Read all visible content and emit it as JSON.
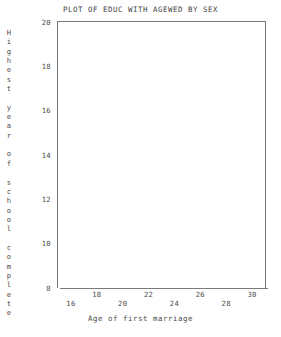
{
  "chart_data": {
    "type": "scatter",
    "title": "PLOT OF EDUC WITH AGEWED BY SEX",
    "xlabel": "Age of first marriage",
    "ylabel": "Highest year of school complete",
    "xlim": [
      15,
      31
    ],
    "ylim": [
      8,
      20
    ],
    "xticks": [
      16,
      18,
      20,
      22,
      24,
      26,
      28,
      30
    ],
    "yticks": [
      20,
      18,
      16,
      14,
      12,
      10,
      8
    ],
    "xtick_labels": [
      "16",
      "18",
      "20",
      "22",
      "24",
      "26",
      "28",
      "30"
    ],
    "ytick_labels": [
      "20",
      "18",
      "16",
      "14",
      "12",
      "10",
      "8"
    ],
    "grid": false,
    "legend": null,
    "series": [],
    "points": []
  },
  "figure": {
    "title": "PLOT OF EDUC WITH AGEWED BY SEX",
    "x_axis": {
      "title": "Age of first marriage",
      "ticks": [
        {
          "label": "16",
          "value": 16,
          "row": "lower"
        },
        {
          "label": "18",
          "value": 18,
          "row": "upper"
        },
        {
          "label": "20",
          "value": 20,
          "row": "lower"
        },
        {
          "label": "22",
          "value": 22,
          "row": "upper"
        },
        {
          "label": "24",
          "value": 24,
          "row": "lower"
        },
        {
          "label": "26",
          "value": 26,
          "row": "upper"
        },
        {
          "label": "28",
          "value": 28,
          "row": "lower"
        },
        {
          "label": "30",
          "value": 30,
          "row": "upper"
        }
      ]
    },
    "y_axis": {
      "title": "Highest year of school complete",
      "title_chars": [
        "H",
        "i",
        "g",
        "h",
        "e",
        "s",
        "t",
        " ",
        "y",
        "e",
        "a",
        "r",
        " ",
        "o",
        "f",
        " ",
        "s",
        "c",
        "h",
        "o",
        "o",
        "l",
        " ",
        "c",
        "o",
        "m",
        "p",
        "l",
        "e",
        "t",
        "e"
      ],
      "ticks": [
        {
          "label": "20",
          "value": 20
        },
        {
          "label": "18",
          "value": 18
        },
        {
          "label": "16",
          "value": 16
        },
        {
          "label": "14",
          "value": 14
        },
        {
          "label": "12",
          "value": 12
        },
        {
          "label": "10",
          "value": 10
        },
        {
          "label": "8",
          "value": 8
        }
      ]
    },
    "colors": {
      "background": "#ffffff",
      "text": "#4a4a4a",
      "axis_line": "#7a7a7a"
    }
  }
}
